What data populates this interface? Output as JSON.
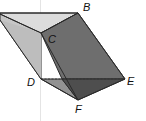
{
  "diagram": {
    "type": "oblique prism",
    "labels": {
      "B": "B",
      "C": "C",
      "D": "D",
      "E": "E",
      "F": "F"
    },
    "vertices": {
      "A": [
        0,
        14
      ],
      "B": [
        78,
        13
      ],
      "C": [
        41,
        33
      ],
      "D": [
        41,
        79
      ],
      "E": [
        125,
        79
      ],
      "F": [
        78,
        100
      ]
    },
    "colors": {
      "top_face": "#d9d9d9",
      "left_face": "#c4c4c4",
      "front_face": "#6b6b6b",
      "bottom_left_face": "#8f8f8f",
      "bottom_right_face": "#4f4f4f",
      "edge": "#2a2a2a",
      "hidden_edge": "#333333"
    }
  }
}
